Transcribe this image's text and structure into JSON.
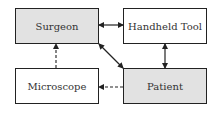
{
  "diagram": {
    "nodes": [
      {
        "id": "surgeon",
        "label": "Surgeon",
        "shaded": true
      },
      {
        "id": "handheld_tool",
        "label": "Handheld Tool",
        "shaded": false
      },
      {
        "id": "microscope",
        "label": "Microscope",
        "shaded": false
      },
      {
        "id": "patient",
        "label": "Patient",
        "shaded": true
      }
    ],
    "edges": [
      {
        "from": "surgeon",
        "to": "handheld_tool",
        "style": "solid",
        "direction": "both"
      },
      {
        "from": "surgeon",
        "to": "patient",
        "style": "solid",
        "direction": "both"
      },
      {
        "from": "handheld_tool",
        "to": "patient",
        "style": "solid",
        "direction": "both"
      },
      {
        "from": "microscope",
        "to": "surgeon",
        "style": "dashed",
        "direction": "forward"
      },
      {
        "from": "patient",
        "to": "microscope",
        "style": "dashed",
        "direction": "forward"
      }
    ],
    "colors": {
      "shaded_fill": "#e2e2e2",
      "plain_fill": "#ffffff",
      "stroke": "#222222"
    }
  }
}
